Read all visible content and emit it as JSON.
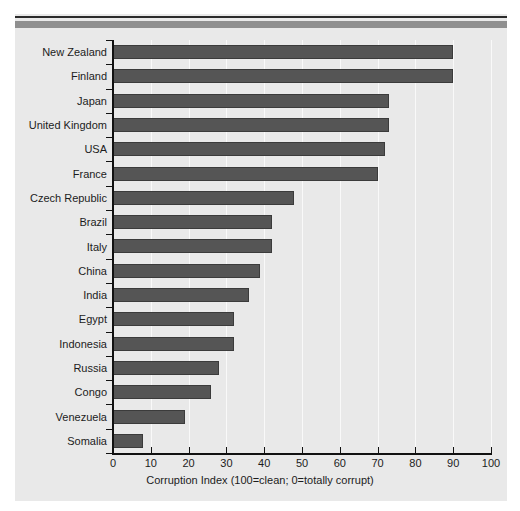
{
  "chart_data": {
    "type": "bar",
    "orientation": "horizontal",
    "title": "",
    "xlabel": "Corruption Index (100=clean; 0=totally corrupt)",
    "ylabel": "",
    "xlim": [
      0,
      100
    ],
    "xticks": [
      0,
      10,
      20,
      30,
      40,
      50,
      60,
      70,
      80,
      90,
      100
    ],
    "grid": "vertical",
    "legend": "none",
    "categories": [
      "New Zealand",
      "Finland",
      "Japan",
      "United Kingdom",
      "USA",
      "France",
      "Czech Republic",
      "Brazil",
      "Italy",
      "China",
      "India",
      "Egypt",
      "Indonesia",
      "Russia",
      "Congo",
      "Venezuela",
      "Somalia"
    ],
    "values": [
      90,
      90,
      73,
      73,
      72,
      70,
      48,
      42,
      42,
      39,
      36,
      32,
      32,
      28,
      26,
      19,
      8
    ],
    "bar_color": "#555555",
    "plot_background": "#e9e9e9",
    "axis_color": "#111111",
    "gridline_color": "#fbfbfb"
  },
  "axis": {
    "x_title": "Corruption Index (100=clean; 0=totally corrupt)",
    "ticks": [
      "0",
      "10",
      "20",
      "30",
      "40",
      "50",
      "60",
      "70",
      "80",
      "90",
      "100"
    ]
  }
}
